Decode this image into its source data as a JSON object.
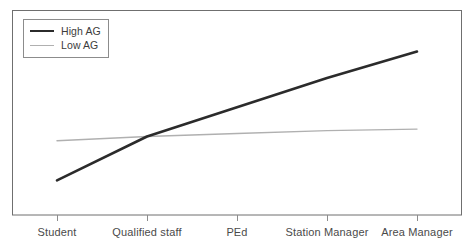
{
  "chart_data": {
    "type": "line",
    "title": "",
    "xlabel": "",
    "ylabel": "",
    "categories": [
      "Student",
      "Qualified staff",
      "PEd",
      "Station Manager",
      "Area Manager"
    ],
    "series": [
      {
        "name": "High AG",
        "values": [
          10,
          40,
          60,
          80,
          98
        ],
        "color": "#2b2b2b",
        "line_width": 2.6
      },
      {
        "name": "Low AG",
        "values": [
          37,
          40,
          42,
          44,
          45
        ],
        "color": "#b0b0b0",
        "line_width": 1.4
      }
    ],
    "ylim": [
      0,
      110
    ],
    "grid": false,
    "legend_position": "top-left",
    "y_axis_ticks_visible": false,
    "x_axis_ticks_visible": true,
    "frame": {
      "left": 12,
      "top": 10,
      "right": 462,
      "bottom": 215,
      "color": "#6f6f6f"
    }
  },
  "legend": {
    "entries": [
      {
        "label": "High AG"
      },
      {
        "label": "Low AG"
      }
    ]
  },
  "axis": {
    "categories": [
      {
        "label": "Student"
      },
      {
        "label": "Qualified staff"
      },
      {
        "label": "PEd"
      },
      {
        "label": "Station Manager"
      },
      {
        "label": "Area Manager"
      }
    ]
  }
}
